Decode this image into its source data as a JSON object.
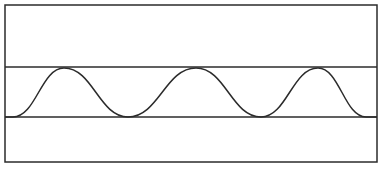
{
  "diagram": {
    "frame": {
      "x": 5,
      "y": 5,
      "width": 372,
      "height": 157
    },
    "upper_line_y": 67,
    "lower_line_y": 117,
    "waveform": {
      "start_x": 13,
      "end_x": 366,
      "peaks_x": [
        64,
        196,
        318
      ],
      "troughs_x": [
        128,
        261
      ],
      "peak_y": 68,
      "trough_y": 117
    },
    "colors": {
      "stroke": "#2b2b2b",
      "background": "#ffffff"
    }
  }
}
